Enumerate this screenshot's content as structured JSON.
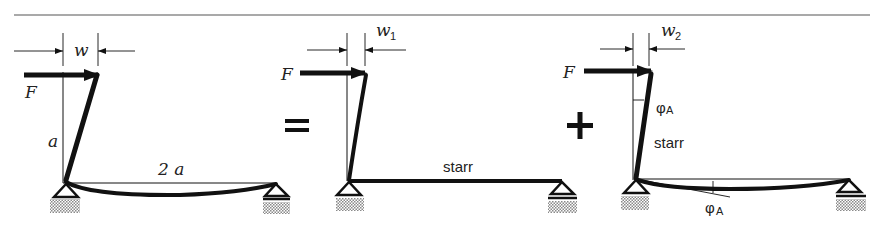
{
  "figure": {
    "equation_operators": {
      "equals": "=",
      "plus": "+"
    },
    "panels": [
      {
        "id": "total",
        "force_label": "F",
        "deflection_label": "w",
        "deflection_sub": "",
        "height_label": "a",
        "span_label": "2 a"
      },
      {
        "id": "case1",
        "force_label": "F",
        "deflection_label": "w",
        "deflection_sub": "1",
        "beam_label": "starr"
      },
      {
        "id": "case2",
        "force_label": "F",
        "deflection_label": "w",
        "deflection_sub": "2",
        "column_label": "starr",
        "rotation_label_top": "φ",
        "rotation_label_top_sub": "A",
        "rotation_label_bottom": "φ",
        "rotation_label_bottom_sub": "A"
      }
    ],
    "colors": {
      "ink": "#111111",
      "hatch": "#9a9a9a",
      "rule": "#555555"
    }
  }
}
